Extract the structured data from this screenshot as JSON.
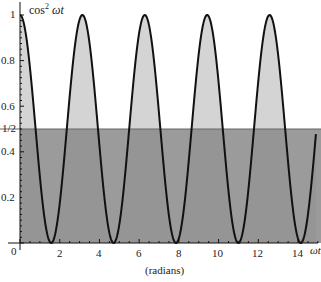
{
  "chart_data": {
    "type": "area",
    "title": "",
    "function": "cos^2(ωt)",
    "ylabel": "cos² ωt",
    "xlabel": "ωt",
    "xunit_label": "(radians)",
    "xlim": [
      0,
      14.9
    ],
    "ylim": [
      0,
      1
    ],
    "x_ticks": [
      0,
      2,
      4,
      6,
      8,
      10,
      12,
      14
    ],
    "x_tick_labels": [
      "0",
      "2",
      "4",
      "6",
      "8",
      "10",
      "12",
      "14"
    ],
    "y_ticks": [
      0.2,
      0.4,
      0.5,
      0.6,
      0.8,
      1
    ],
    "y_tick_labels": [
      "0.2",
      "0.4",
      "1/2",
      "0.6",
      "0.8",
      "1"
    ],
    "reference_line": {
      "y": 0.5,
      "label": "1/2"
    },
    "peaks_x": [
      0,
      3.1416,
      6.2832,
      9.4248,
      12.5664
    ],
    "zeros_x": [
      1.5708,
      4.7124,
      7.854,
      10.9956,
      14.1372
    ],
    "grid": false,
    "colors": {
      "curve": "#111111",
      "fill_under_curve": "#d4d4d4",
      "fill_below_half": "#8a8a8a",
      "overlap_dark": "#7a7a7a"
    }
  },
  "labels": {
    "y_axis_title": "cos",
    "y_axis_sup": "2",
    "y_axis_var": " ωt",
    "x_axis_var": "ωt",
    "x_unit": "(radians)",
    "y1": "1",
    "y08": "0.8",
    "y06": "0.6",
    "yhalf": "1/2",
    "y04": "0.4",
    "y02": "0.2",
    "x0": "0",
    "x2": "2",
    "x4": "4",
    "x6": "6",
    "x8": "8",
    "x10": "10",
    "x12": "12",
    "x14": "14"
  }
}
